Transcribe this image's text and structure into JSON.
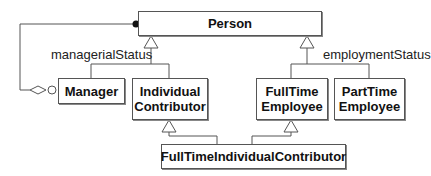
{
  "diagram": {
    "type": "UML class diagram",
    "classes": [
      {
        "id": "person",
        "name": "Person"
      },
      {
        "id": "manager",
        "name": "Manager"
      },
      {
        "id": "individual-contributor",
        "name_line1": "Individual",
        "name_line2": "Contributor"
      },
      {
        "id": "fulltime-employee",
        "name_line1": "FullTime",
        "name_line2": "Employee"
      },
      {
        "id": "parttime-employee",
        "name_line1": "PartTime",
        "name_line2": "Employee"
      },
      {
        "id": "fulltime-individual-contributor",
        "name": "FullTimeIndividualContributor"
      }
    ],
    "generalization_sets": [
      {
        "label": "managerialStatus",
        "parent": "Person",
        "children": [
          "Manager",
          "IndividualContributor"
        ]
      },
      {
        "label": "employmentStatus",
        "parent": "Person",
        "children": [
          "FullTimeEmployee",
          "PartTimeEmployee"
        ]
      }
    ],
    "multiple_inheritance": {
      "child": "FullTimeIndividualContributor",
      "parents": [
        "IndividualContributor",
        "FullTimeEmployee"
      ]
    },
    "association": {
      "from": "Manager",
      "to": "Person",
      "kind": "aggregation",
      "end_marker_person": "filled-circle",
      "end_marker_manager": "hollow-diamond-and-circle"
    },
    "colors": {
      "line": "#555555",
      "box_border": "#555555",
      "text": "#111111",
      "background": "#ffffff"
    }
  }
}
